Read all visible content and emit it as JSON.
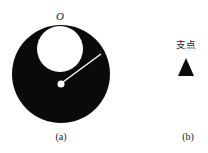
{
  "figure_a": {
    "top_label": "O",
    "caption": "(a)",
    "disk": {
      "cx": 61,
      "cy": 74,
      "r": 49,
      "color": "#0a0a0a"
    },
    "hole": {
      "cx": 60,
      "cy": 49,
      "r": 23,
      "color": "#ffffff"
    },
    "pivot_dot": {
      "cx": 61,
      "cy": 84,
      "r": 3.5,
      "color": "#ffffff"
    },
    "radius_line": {
      "x1": 63,
      "y1": 82,
      "x2": 101,
      "y2": 54,
      "color": "#ffffff"
    }
  },
  "figure_b": {
    "label": "支点",
    "caption": "(b)",
    "triangle": {
      "apex": [
        186,
        58
      ],
      "base_left": [
        178,
        76
      ],
      "base_right": [
        194,
        76
      ],
      "color": "#0a0a0a"
    }
  }
}
